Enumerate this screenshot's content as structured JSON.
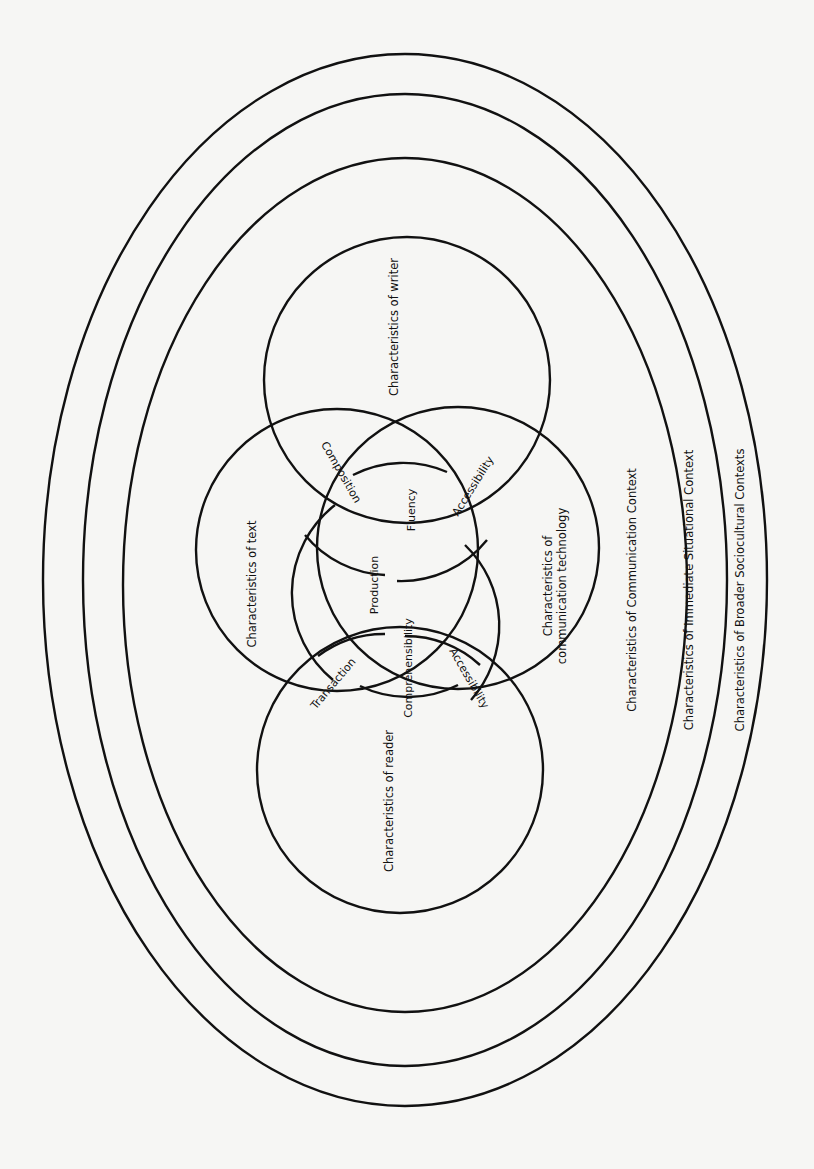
{
  "diagram": {
    "stroke_color": "#111111",
    "background_color": "#f6f6f4",
    "contexts": [
      {
        "label": "Characteristics of Broader Sociocultural Contexts",
        "level": "outermost"
      },
      {
        "label": "Characteristics of Immediate Situational Context",
        "level": "middle"
      },
      {
        "label": "Characteristics of Communication Context",
        "level": "inner"
      }
    ],
    "circles": {
      "writer": {
        "label": "Characteristics of writer"
      },
      "text": {
        "label": "Characteristics of text"
      },
      "technology": {
        "label_line1": "Characteristics of",
        "label_line2": "communication technology"
      },
      "reader": {
        "label": "Characteristics of reader"
      }
    },
    "overlaps": {
      "writer_text": "Composition",
      "writer_technology": "Accessibility",
      "writer_center": "Fluency",
      "center": "Production",
      "text_reader": "Transaction",
      "reader_center": "Comprehensibility",
      "reader_technology": "Accessibility"
    }
  }
}
